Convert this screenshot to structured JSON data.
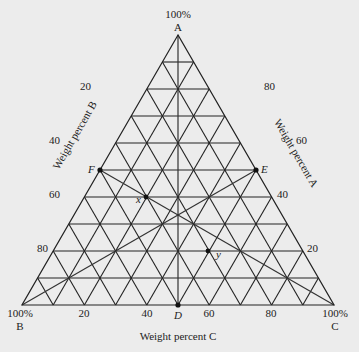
{
  "diagram": {
    "type": "ternary-phase-diagram",
    "vertices": {
      "A": {
        "label": "A",
        "percent": "100%"
      },
      "B": {
        "label": "B",
        "percent": "100%"
      },
      "C": {
        "label": "C",
        "percent": "100%"
      }
    },
    "axes": {
      "left": {
        "title": "Weight percent B",
        "ticks": [
          "20",
          "40",
          "60",
          "80"
        ]
      },
      "right": {
        "title": "Weight percent A",
        "ticks": [
          "80",
          "60",
          "40",
          "20"
        ]
      },
      "bottom": {
        "title": "Weight percent C",
        "ticks": [
          "20",
          "40",
          "60",
          "80"
        ]
      }
    },
    "grid_divisions": 10,
    "points": {
      "D": "D",
      "E": "E",
      "F": "F",
      "x": "x",
      "y": "y"
    },
    "colors": {
      "background": "#ececec",
      "lines": "#222222"
    }
  }
}
